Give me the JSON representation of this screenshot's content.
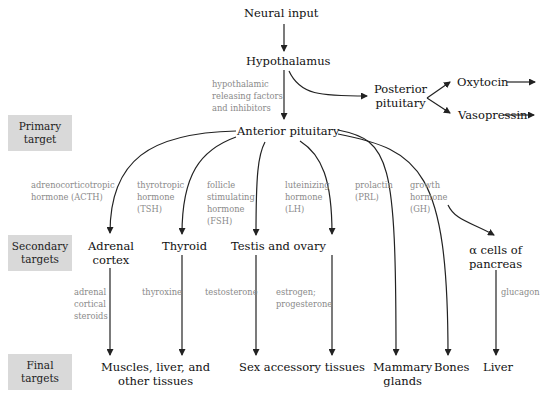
{
  "levels": [
    {
      "id": "primary",
      "label_line1": "Primary",
      "label_line2": "target"
    },
    {
      "id": "secondary",
      "label_line1": "Secondary",
      "label_line2": "targets"
    },
    {
      "id": "final",
      "label_line1": "Final",
      "label_line2": "targets"
    }
  ],
  "nodes": {
    "neural_input": "Neural input",
    "hypothalamus": "Hypothalamus",
    "posterior_pituitary_1": "Posterior",
    "posterior_pituitary_2": "pituitary",
    "oxytocin": "Oxytocin",
    "vasopressin": "Vasopressin",
    "anterior_pituitary": "Anterior pituitary",
    "adrenal_cortex_1": "Adrenal",
    "adrenal_cortex_2": "cortex",
    "thyroid": "Thyroid",
    "testis_ovary": "Testis and ovary",
    "alpha_cells_1": "α cells of",
    "alpha_cells_2": "pancreas",
    "muscles_1": "Muscles, liver, and",
    "muscles_2": "other tissues",
    "sex_accessory": "Sex accessory tissues",
    "mammary_1": "Mammary",
    "mammary_2": "glands",
    "bones": "Bones",
    "liver": "Liver"
  },
  "hormones": {
    "releasing": [
      "hypothalamic",
      "releasing factors",
      "and inhibitors"
    ],
    "acth": [
      "adrenocorticotropic",
      "hormone (ACTH)"
    ],
    "tsh": [
      "thyrotropic",
      "hormone",
      "(TSH)"
    ],
    "fsh": [
      "follicle",
      "stimulating",
      "hormone",
      "(FSH)"
    ],
    "lh": [
      "luteinizing",
      "hormone",
      "(LH)"
    ],
    "prl": [
      "prolactin",
      "(PRL)"
    ],
    "gh": [
      "growth",
      "hormone",
      "(GH)"
    ],
    "adrenal_steroids": [
      "adrenal",
      "cortical",
      "steroids"
    ],
    "thyroxine": [
      "thyroxine"
    ],
    "testosterone": [
      "testosterone"
    ],
    "estrogen": [
      "estrogen;",
      "progesterone"
    ],
    "glucagon": [
      "glucagon"
    ]
  },
  "colors": {
    "label_box": "#d9d9d9",
    "hormone_text": "#8a8a8a",
    "node_text": "#111111",
    "arrow": "#222222"
  }
}
